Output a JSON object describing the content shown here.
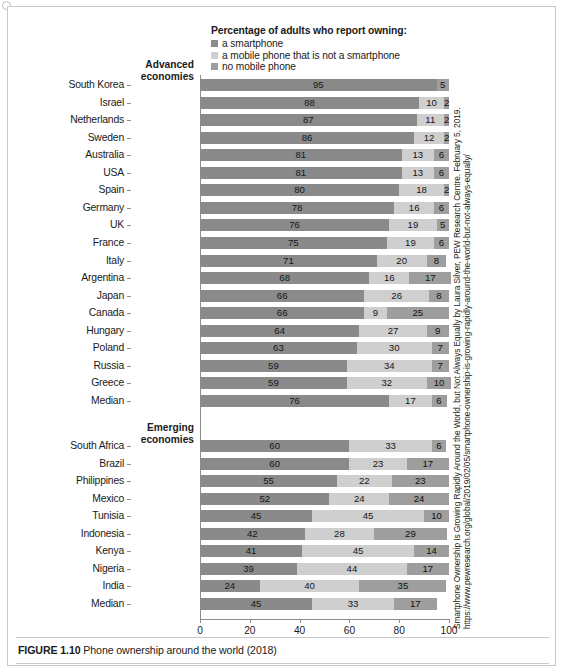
{
  "legend": {
    "title": "Percentage of adults who report owning:",
    "items": [
      {
        "label": "a smartphone",
        "color": "#8a8a8a",
        "key": "smartphone"
      },
      {
        "label": "a mobile phone that is not a smartphone",
        "color": "#cfcfcf",
        "key": "feature_phone"
      },
      {
        "label": "no mobile phone",
        "color": "#9e9e9e",
        "key": "no_phone"
      }
    ]
  },
  "groups": {
    "advanced": "Advanced\neconomies",
    "advanced_line1": "Advanced",
    "advanced_line2": "economies",
    "emerging_line1": "Emerging",
    "emerging_line2": "economies"
  },
  "axis": {
    "ticks": [
      "0",
      "20",
      "40",
      "60",
      "80",
      "100"
    ],
    "min": 0,
    "max": 100
  },
  "caption": {
    "figure_number": "FIGURE 1.10",
    "text": "Phone ownership around the world (2018)"
  },
  "source": {
    "text": "Smartphone Ownership Is Growing Rapidly Around the World, but Not Always Equally by Laura Silver, PEW Research Centre. February 5, 2019. https://www.pewresearch.org/global/2019/02/05/smartphone-ownership-is-growing-rapidly-around-the-world-but-not-always-equally/"
  },
  "chart_data": {
    "type": "bar",
    "orientation": "horizontal",
    "stacked": true,
    "title": "Phone ownership around the world (2018)",
    "xlabel": "",
    "ylabel": "",
    "xlim": [
      0,
      100
    ],
    "xticks": [
      0,
      20,
      40,
      60,
      80,
      100
    ],
    "grid": false,
    "legend_position": "top",
    "series": [
      {
        "name": "a smartphone",
        "color": "#8a8a8a"
      },
      {
        "name": "a mobile phone that is not a smartphone",
        "color": "#cfcfcf"
      },
      {
        "name": "no mobile phone",
        "color": "#9e9e9e"
      }
    ],
    "groups": [
      {
        "name": "Advanced economies",
        "rows": [
          {
            "category": "South Korea",
            "values": [
              95,
              0,
              5
            ]
          },
          {
            "category": "Israel",
            "values": [
              88,
              10,
              2
            ]
          },
          {
            "category": "Netherlands",
            "values": [
              87,
              11,
              2
            ]
          },
          {
            "category": "Sweden",
            "values": [
              86,
              12,
              2
            ]
          },
          {
            "category": "Australia",
            "values": [
              81,
              13,
              6
            ]
          },
          {
            "category": "USA",
            "values": [
              81,
              13,
              6
            ]
          },
          {
            "category": "Spain",
            "values": [
              80,
              18,
              2
            ]
          },
          {
            "category": "Germany",
            "values": [
              78,
              16,
              6
            ]
          },
          {
            "category": "UK",
            "values": [
              76,
              19,
              5
            ]
          },
          {
            "category": "France",
            "values": [
              75,
              19,
              6
            ]
          },
          {
            "category": "Italy",
            "values": [
              71,
              20,
              8
            ]
          },
          {
            "category": "Argentina",
            "values": [
              68,
              16,
              17
            ]
          },
          {
            "category": "Japan",
            "values": [
              66,
              26,
              8
            ]
          },
          {
            "category": "Canada",
            "values": [
              66,
              9,
              25
            ]
          },
          {
            "category": "Hungary",
            "values": [
              64,
              27,
              9
            ]
          },
          {
            "category": "Poland",
            "values": [
              63,
              30,
              7
            ]
          },
          {
            "category": "Russia",
            "values": [
              59,
              34,
              7
            ]
          },
          {
            "category": "Greece",
            "values": [
              59,
              32,
              10
            ]
          },
          {
            "category": "Median",
            "values": [
              76,
              17,
              6
            ]
          }
        ]
      },
      {
        "name": "Emerging economies",
        "rows": [
          {
            "category": "South Africa",
            "values": [
              60,
              33,
              6
            ]
          },
          {
            "category": "Brazil",
            "values": [
              60,
              23,
              17
            ]
          },
          {
            "category": "Philippines",
            "values": [
              55,
              22,
              23
            ]
          },
          {
            "category": "Mexico",
            "values": [
              52,
              24,
              24
            ]
          },
          {
            "category": "Tunisia",
            "values": [
              45,
              45,
              10
            ]
          },
          {
            "category": "Indonesia",
            "values": [
              42,
              28,
              29
            ]
          },
          {
            "category": "Kenya",
            "values": [
              41,
              45,
              14
            ]
          },
          {
            "category": "Nigeria",
            "values": [
              39,
              44,
              17
            ]
          },
          {
            "category": "India",
            "values": [
              24,
              40,
              35
            ]
          },
          {
            "category": "Median",
            "values": [
              45,
              33,
              17
            ]
          }
        ]
      }
    ]
  }
}
